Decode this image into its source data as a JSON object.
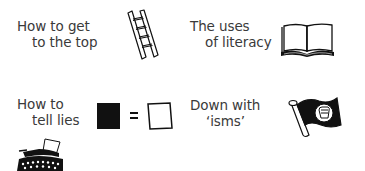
{
  "items": [
    {
      "line1": "How to get",
      "line2": "to the top",
      "icon": "ladder-icon"
    },
    {
      "line1": "The uses",
      "line2": "of literacy",
      "icon": "open-book-icon"
    },
    {
      "line1": "How to",
      "line2": "tell lies",
      "icon": "black-equals-white-icon"
    },
    {
      "line1": "Down with",
      "line2": "‘isms’",
      "icon": "fist-flag-icon"
    }
  ],
  "extra_icon": "typewriter-icon",
  "colors": {
    "ink": "#111111",
    "text": "#3a3a3a",
    "background": "#ffffff"
  }
}
